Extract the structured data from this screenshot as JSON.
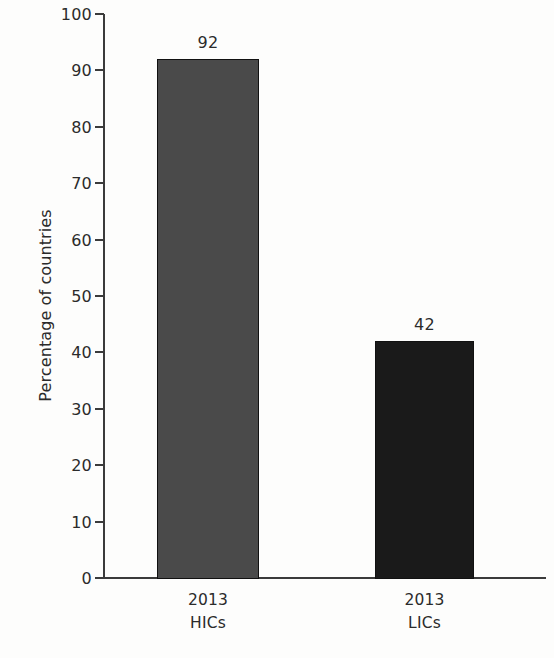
{
  "chart_data": {
    "type": "bar",
    "title": "",
    "subtitle": "",
    "xlabel": "",
    "ylabel": "Percentage of countries",
    "categories": [
      "2013 HICs",
      "2013 LICs"
    ],
    "category_lines": [
      [
        "2013",
        "HICs"
      ],
      [
        "2013",
        "LICs"
      ]
    ],
    "values": [
      92,
      42
    ],
    "data_labels": [
      "92",
      "42"
    ],
    "ylim": [
      0,
      100
    ],
    "yticks": [
      0,
      10,
      20,
      30,
      40,
      50,
      60,
      70,
      80,
      90,
      100
    ],
    "ytick_labels": [
      "0",
      "10",
      "20",
      "30",
      "40",
      "50",
      "60",
      "70",
      "80",
      "90",
      "100"
    ],
    "grid": false,
    "legend": null,
    "legend_position": "none",
    "bar_colors": [
      "#4a4a4a",
      "#1a1a1a"
    ],
    "bar_edge_color": "#111111",
    "axis_color": "#3b3b3b",
    "background_color": "#fdfdfc",
    "text_color": "#2b2b2b"
  },
  "bleed_through": {
    "line1": "",
    "line2": "",
    "line3": "",
    "line4": "",
    "line5": "",
    "line6": ""
  }
}
